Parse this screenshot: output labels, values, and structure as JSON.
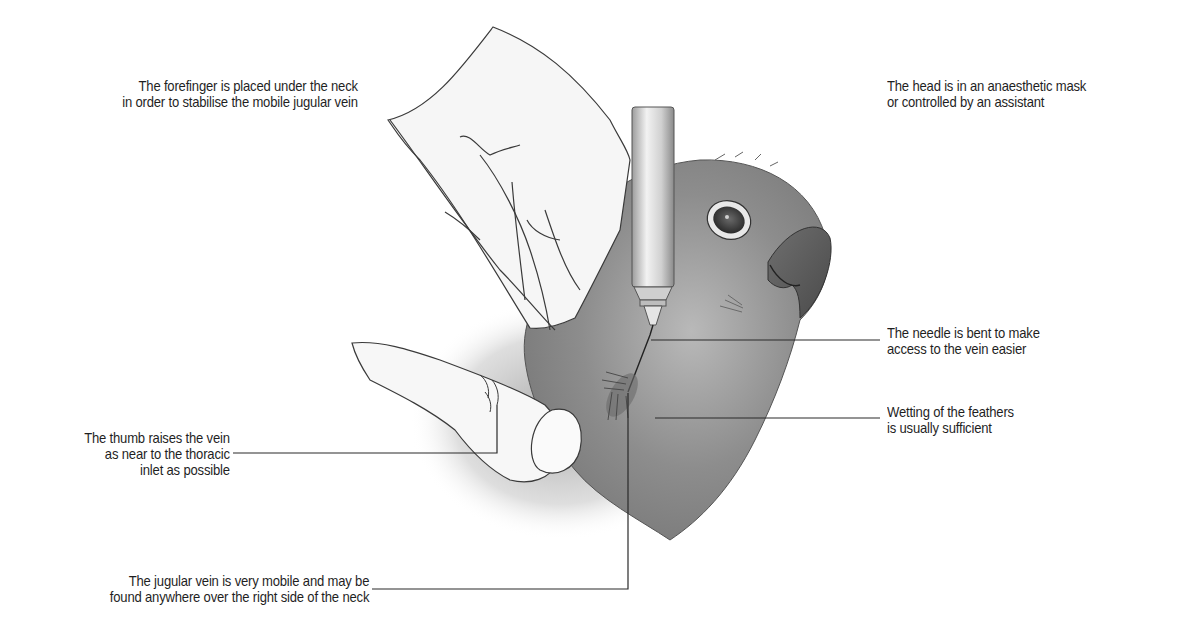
{
  "figure": {
    "colors": {
      "background": "#ffffff",
      "text": "#1f1f1f",
      "leader_line": "#2a2a2a",
      "outline": "#3a3a3a",
      "bird_shading": "#8a8a8a",
      "hand_shading": "#d9d9d9"
    }
  },
  "labels": {
    "forefinger": {
      "line1": "The forefinger is placed under the neck",
      "line2": "in order to stabilise the mobile jugular vein"
    },
    "head": {
      "line1": "The head is in an anaesthetic mask",
      "line2": "or controlled by an assistant"
    },
    "needle": {
      "line1": "The needle is bent to make",
      "line2": "access to the vein easier"
    },
    "feathers": {
      "line1": "Wetting of the feathers",
      "line2": "is usually sufficient"
    },
    "thumb": {
      "line1": "The thumb raises the vein",
      "line2": "as near to the thoracic",
      "line3": "inlet as possible"
    },
    "jugular": {
      "line1": "The jugular vein is very mobile and may be",
      "line2": "found anywhere over the right side of the neck"
    }
  }
}
